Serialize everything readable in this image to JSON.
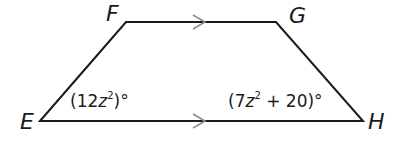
{
  "figure": {
    "type": "trapezoid",
    "vertices": [
      {
        "name": "E",
        "label": "E"
      },
      {
        "name": "F",
        "label": "F"
      },
      {
        "name": "G",
        "label": "G"
      },
      {
        "name": "H",
        "label": "H"
      }
    ],
    "parallel_sides": [
      "FG",
      "EH"
    ],
    "angles": {
      "E": {
        "coef": "12",
        "var": "z",
        "exp": "2",
        "rest": "",
        "label": "(12z²)°"
      },
      "H": {
        "coef": "7",
        "var": "z",
        "exp": "2",
        "rest": " + 20",
        "label": "(7z² + 20)°"
      }
    },
    "stroke_color": "#1a1a1a",
    "arrow_color": "#8a8a8a"
  }
}
